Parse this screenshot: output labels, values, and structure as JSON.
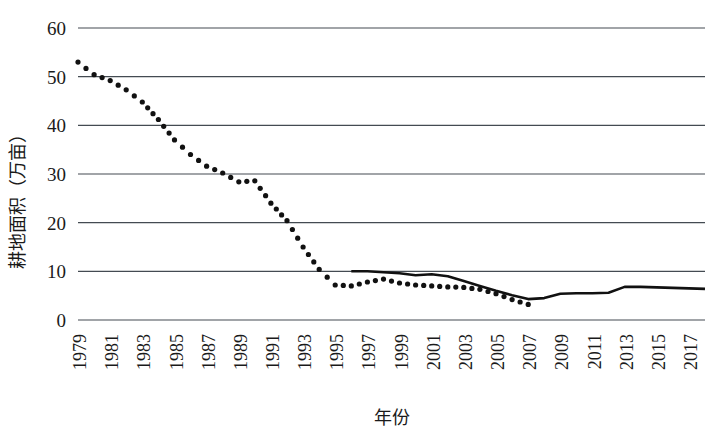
{
  "chart_data": {
    "type": "line",
    "title": "",
    "xlabel": "年份",
    "ylabel": "耕地面积（万亩）",
    "ylim": [
      0,
      60
    ],
    "ytick_values": [
      0,
      10,
      20,
      30,
      40,
      50,
      60
    ],
    "ytick_labels": [
      "0",
      "10",
      "20",
      "30",
      "40",
      "50",
      "60"
    ],
    "xlim": [
      1979,
      2018
    ],
    "xtick_labels": [
      "1979",
      "1981",
      "1983",
      "1985",
      "1987",
      "1989",
      "1991",
      "1993",
      "1995",
      "1997",
      "1999",
      "2001",
      "2003",
      "2005",
      "2007",
      "2009",
      "2011",
      "2013",
      "2015",
      "2017"
    ],
    "grid": true,
    "legend": "none",
    "series": [
      {
        "name": "dotted-series",
        "style": "dotted",
        "marker": "circle",
        "color": "#111111",
        "x": [
          1979,
          1980,
          1981,
          1982,
          1983,
          1984,
          1985,
          1986,
          1987,
          1988,
          1989,
          1990,
          1991,
          1992,
          1993,
          1994,
          1995,
          1996,
          1997,
          1998,
          1999,
          2000,
          2001,
          2002,
          2003,
          2004,
          2005,
          2006,
          2007
        ],
        "values": [
          53.0,
          50.4,
          49.2,
          47.3,
          44.8,
          41.2,
          37.0,
          34.0,
          31.6,
          30.2,
          28.4,
          28.6,
          24.0,
          20.4,
          15.0,
          10.4,
          7.2,
          7.0,
          7.8,
          8.4,
          7.6,
          7.2,
          7.0,
          6.8,
          6.7,
          6.3,
          5.4,
          4.2,
          3.2
        ]
      },
      {
        "name": "solid-series",
        "style": "solid",
        "marker": "none",
        "color": "#111111",
        "x": [
          1996,
          1997,
          1998,
          1999,
          2000,
          2001,
          2002,
          2003,
          2004,
          2005,
          2006,
          2007,
          2008,
          2009,
          2010,
          2011,
          2012,
          2013,
          2014,
          2015,
          2016,
          2017,
          2018
        ],
        "values": [
          10.0,
          10.0,
          9.8,
          9.6,
          9.2,
          9.4,
          9.0,
          8.0,
          7.0,
          6.0,
          5.1,
          4.3,
          4.5,
          5.4,
          5.5,
          5.5,
          5.6,
          6.8,
          6.8,
          6.7,
          6.6,
          6.5,
          6.4
        ]
      }
    ]
  }
}
